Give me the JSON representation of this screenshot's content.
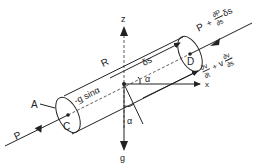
{
  "diagram": {
    "type": "fluid element along streamline",
    "labels": {
      "z_axis": "z",
      "x_axis": "x",
      "g_vector": "g",
      "radius": "R",
      "area": "A",
      "center_c": "C",
      "center_d": "D",
      "delta_s": "δs",
      "alpha_top": "α",
      "alpha_bottom": "α",
      "gravity_component_prefix": "-",
      "gravity_component_g": "g",
      "gravity_component_suffix": " sinα",
      "pressure_in": "P",
      "pressure_out_p": "P",
      "pressure_out_plus": "+",
      "pressure_out_num": "∂P",
      "pressure_out_den": "∂s",
      "pressure_out_ds": "δs",
      "accel_num1": "∂v",
      "accel_den1": "∂t",
      "accel_plus": "+",
      "accel_v": "v",
      "accel_num2": "∂v",
      "accel_den2": "∂s"
    },
    "colors": {
      "line": "#222222",
      "background": "#ffffff"
    }
  }
}
